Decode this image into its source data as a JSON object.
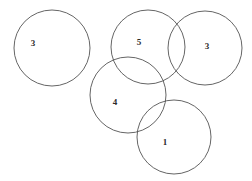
{
  "diagram": {
    "type": "circle-overlap-diagram",
    "background_color": "#ffffff",
    "stroke_color": "#545454",
    "label_color": "#2b2b2b",
    "canvas": {
      "width": 252,
      "height": 181
    },
    "circles": [
      {
        "id": "circle-left",
        "label": "3",
        "cx": 52,
        "cy": 48,
        "r": 38,
        "label_x": 33,
        "label_y": 43
      },
      {
        "id": "circle-top-middle",
        "label": "5",
        "cx": 148,
        "cy": 47,
        "r": 37,
        "label_x": 139,
        "label_y": 42
      },
      {
        "id": "circle-right",
        "label": "3",
        "cx": 205,
        "cy": 48,
        "r": 37,
        "label_x": 207,
        "label_y": 46
      },
      {
        "id": "circle-middle-lower",
        "label": "4",
        "cx": 128,
        "cy": 95,
        "r": 38,
        "label_x": 115,
        "label_y": 102
      },
      {
        "id": "circle-bottom-right",
        "label": "1",
        "cx": 174,
        "cy": 137,
        "r": 37,
        "label_x": 165,
        "label_y": 142
      }
    ]
  }
}
